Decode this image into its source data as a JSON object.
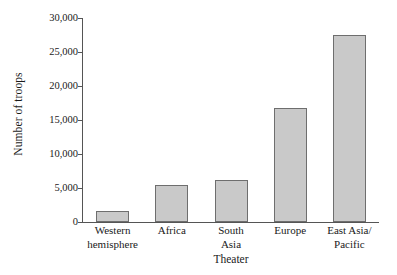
{
  "chart_data": {
    "type": "bar",
    "title": "",
    "subtitle": "",
    "xlabel": "Theater",
    "ylabel": "Number of troops",
    "categories": [
      "Western\nhemisphere",
      "Africa",
      "South\nAsia",
      "Europe",
      "East Asia/\nPacific"
    ],
    "values": [
      1600,
      5500,
      6200,
      16700,
      27500
    ],
    "ylim": [
      0,
      30000
    ],
    "yticks": [
      0,
      5000,
      10000,
      15000,
      20000,
      25000,
      30000
    ],
    "ytick_labels": [
      "0",
      "5,000",
      "10,000",
      "15,000",
      "20,000",
      "25,000",
      "30,000"
    ],
    "grid": false,
    "legend": false,
    "legend_position": "none",
    "bar_fill_color": "#c9c9c9",
    "bar_edge_color": "#6e6e6e",
    "axis_color": "#555555",
    "background_color": "#ffffff"
  }
}
